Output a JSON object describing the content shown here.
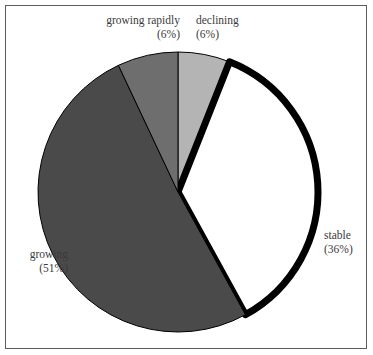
{
  "figure": {
    "background_color": "#ffffff",
    "frame_color": "#5c5c5c",
    "label_color": "#3b3b3b"
  },
  "chart_data": {
    "type": "pie",
    "title": "",
    "subtitle": "",
    "xlabel": "",
    "ylabel": "",
    "legend_position": "none",
    "grid": false,
    "start_angle_deg": 0,
    "direction": "clockwise",
    "categories": [
      "declining",
      "stable",
      "growing",
      "growing rapidly"
    ],
    "values": [
      6,
      36,
      51,
      6
    ],
    "units": "percent",
    "slices": [
      {
        "label": "declining",
        "value": 6,
        "percent_text": "(6%)",
        "color": "#b4b4b4",
        "edge_color": "#000000",
        "edge_width": 1,
        "start_deg": 0.0,
        "end_deg": 21.6,
        "label_position": "top-right"
      },
      {
        "label": "stable",
        "value": 36,
        "percent_text": "(36%)",
        "color": "#ffffff",
        "edge_color": "#000000",
        "edge_width": 7,
        "start_deg": 21.6,
        "end_deg": 151.2,
        "label_position": "right"
      },
      {
        "label": "growing",
        "value": 51,
        "percent_text": "(51%)",
        "color": "#4a4a4a",
        "edge_color": "#000000",
        "edge_width": 1,
        "start_deg": 151.2,
        "end_deg": 334.8,
        "label_position": "left"
      },
      {
        "label": "growing rapidly",
        "value": 6,
        "percent_text": "(6%)",
        "color": "#6e6e6e",
        "edge_color": "#000000",
        "edge_width": 1,
        "start_deg": 334.8,
        "end_deg": 360.0,
        "label_position": "top-left"
      }
    ],
    "geometry": {
      "center_x": 178,
      "center_y": 192,
      "radius": 140
    }
  }
}
